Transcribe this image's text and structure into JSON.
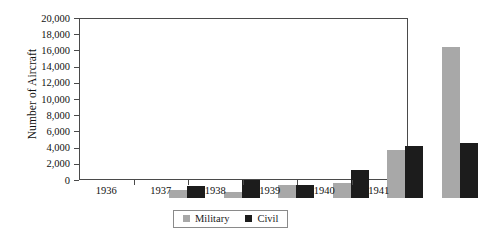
{
  "chart_data": {
    "type": "bar",
    "title": "",
    "subtitle": "",
    "xlabel": "",
    "ylabel": "Number of Aircraft",
    "categories": [
      "1936",
      "1937",
      "1938",
      "1939",
      "1940",
      "1941"
    ],
    "series": [
      {
        "name": "Military",
        "color": "#a8a8a8",
        "values": [
          1000,
          800,
          1600,
          1900,
          6000,
          18900
        ]
      },
      {
        "name": "Civil",
        "color": "#1c1c1c",
        "values": [
          1550,
          2300,
          1650,
          3500,
          6500,
          6900
        ]
      }
    ],
    "ylim": [
      0,
      20000
    ],
    "ytick_values": [
      0,
      2000,
      4000,
      6000,
      8000,
      10000,
      12000,
      14000,
      16000,
      18000,
      20000
    ],
    "ytick_labels": [
      "0",
      "2,000",
      "4,000",
      "6,000",
      "8,000",
      "10,000",
      "12,000",
      "14,000",
      "16,000",
      "18,000",
      "20,000"
    ],
    "grid": false,
    "legend_position": "bottom-center",
    "legend_entries": [
      "Military",
      "Civil"
    ]
  },
  "axes": {
    "y_title": "Number of Aircraft"
  },
  "legend": {
    "items": [
      {
        "label": "Military"
      },
      {
        "label": "Civil"
      }
    ]
  }
}
